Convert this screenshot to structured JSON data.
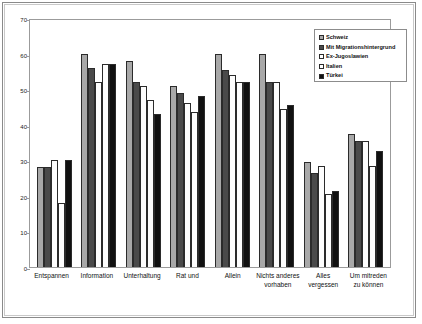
{
  "chart_data": {
    "type": "bar",
    "title": "",
    "xlabel": "",
    "ylabel": "",
    "ylim": [
      0,
      70
    ],
    "yticks": [
      0,
      10,
      20,
      30,
      40,
      50,
      60,
      70
    ],
    "grid": false,
    "legend_position": "top-right",
    "categories": [
      "Entspannen",
      "Information",
      "Unterhaltung",
      "Rat und",
      "Allein",
      "Nichts anderes vorhaben",
      "Alles vergessen",
      "Um mitreden zu können"
    ],
    "series": [
      {
        "name": "Schweiz",
        "color": "#a8a8a8",
        "values": [
          28.0,
          60.0,
          58.0,
          51.0,
          60.0,
          60.0,
          29.5,
          37.5
        ]
      },
      {
        "name": "Mit Migrationshintergrund",
        "color": "#4a4a4a",
        "values": [
          28.0,
          56.0,
          52.0,
          49.0,
          55.5,
          52.0,
          26.5,
          35.5
        ]
      },
      {
        "name": "Ex-Jugoslawien",
        "color": "#ffffff",
        "values": [
          30.0,
          52.0,
          51.0,
          46.0,
          54.0,
          52.0,
          28.5,
          35.5
        ]
      },
      {
        "name": "Italien",
        "color": "#ffffff",
        "values": [
          18.0,
          57.0,
          47.0,
          43.5,
          52.0,
          44.5,
          20.5,
          28.5
        ]
      },
      {
        "name": "Türkei",
        "color": "#111111",
        "values": [
          30.0,
          57.0,
          43.0,
          48.0,
          52.0,
          45.5,
          21.5,
          32.5
        ]
      }
    ]
  },
  "legend": {
    "entries": [
      {
        "label": "Schweiz",
        "swatch": "#a8a8a8"
      },
      {
        "label": "Mit Migrationshintergrund",
        "swatch": "#4a4a4a"
      },
      {
        "label": "Ex-Jugoslawien",
        "swatch": "#ffffff"
      },
      {
        "label": "Italien",
        "swatch": "#ffffff"
      },
      {
        "label": "Türkei",
        "swatch": "#111111"
      }
    ]
  }
}
